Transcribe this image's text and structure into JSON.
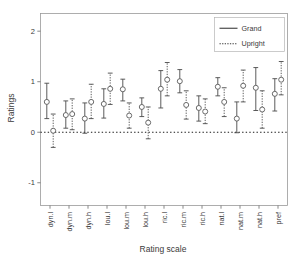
{
  "chart_data": {
    "type": "scatter",
    "title": "",
    "xlabel": "Rating scale",
    "ylabel": "Ratings",
    "categories": [
      "dyn.l",
      "dyn.m",
      "dyn.h",
      "lou.l",
      "lou.m",
      "lou.h",
      "ric.l",
      "ric.m",
      "ric.h",
      "nat.l",
      "nat.m",
      "nat.h",
      "pref"
    ],
    "ylim": [
      -1.45,
      2.35
    ],
    "yticks": [
      -1,
      0,
      1,
      2
    ],
    "ytick_labels": [
      "-1",
      "0",
      "1",
      "2"
    ],
    "grid": false,
    "reference_line": {
      "y": 0,
      "style": "dotted",
      "color": "#1a1a1a"
    },
    "legend": {
      "position": "top-right",
      "entries": [
        {
          "name": "Grand",
          "style": "solid"
        },
        {
          "name": "Upright",
          "style": "dotted"
        }
      ]
    },
    "series": [
      {
        "name": "Grand",
        "style": "solid",
        "marker": "open-circle",
        "values": [
          0.6,
          0.34,
          0.27,
          0.56,
          0.85,
          0.5,
          0.86,
          1.01,
          0.48,
          0.9,
          0.27,
          0.88,
          0.76
        ],
        "ci_low": [
          0.27,
          0.08,
          -0.02,
          0.28,
          0.62,
          0.31,
          0.48,
          0.78,
          0.22,
          0.72,
          -0.01,
          0.43,
          0.42
        ],
        "ci_high": [
          0.97,
          0.62,
          0.58,
          0.86,
          1.05,
          0.68,
          1.22,
          1.24,
          0.72,
          1.08,
          0.6,
          1.28,
          1.06
        ]
      },
      {
        "name": "Upright",
        "style": "dotted",
        "marker": "open-circle",
        "values": [
          0.03,
          0.36,
          0.6,
          0.86,
          0.33,
          0.19,
          1.04,
          0.54,
          0.41,
          0.6,
          0.92,
          0.45,
          1.04
        ],
        "ci_low": [
          -0.3,
          0.05,
          0.27,
          0.55,
          0.08,
          -0.13,
          0.72,
          0.26,
          0.17,
          0.31,
          0.6,
          0.08,
          0.74
        ],
        "ci_high": [
          0.36,
          0.66,
          0.95,
          1.17,
          0.58,
          0.5,
          1.38,
          0.82,
          0.66,
          0.88,
          1.23,
          0.82,
          1.4
        ]
      }
    ]
  },
  "colors": {
    "background": "#ffffff",
    "frame": "#9a9a9a",
    "ink": "#3a3a3a",
    "series": "#4a4a4a"
  }
}
